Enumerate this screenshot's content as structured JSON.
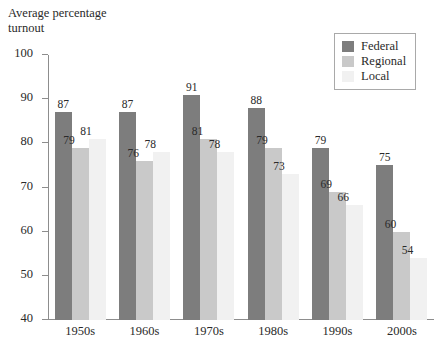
{
  "chart_data": {
    "type": "bar",
    "title": "",
    "xlabel": "",
    "ylabel": "Average percentage\nturnout",
    "ylim": [
      40,
      100
    ],
    "ytick_step": 10,
    "yticks": [
      100,
      90,
      80,
      70,
      60,
      50,
      40
    ],
    "grid": false,
    "legend_position": "top-right",
    "categories": [
      "1950s",
      "1960s",
      "1970s",
      "1980s",
      "1990s",
      "2000s"
    ],
    "series": [
      {
        "name": "Federal",
        "color": "#7d7d7d",
        "values": [
          87,
          87,
          91,
          88,
          79,
          75
        ]
      },
      {
        "name": "Regional",
        "color": "#c9c9c9",
        "values": [
          79,
          76,
          81,
          79,
          69,
          60
        ]
      },
      {
        "name": "Local",
        "color": "#f1f1f1",
        "values": [
          81,
          78,
          78,
          73,
          66,
          54
        ]
      }
    ]
  },
  "legend": {
    "items": [
      {
        "label": "Federal"
      },
      {
        "label": "Regional"
      },
      {
        "label": "Local"
      }
    ]
  }
}
